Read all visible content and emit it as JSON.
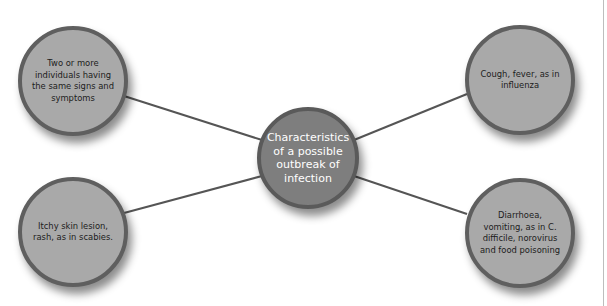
{
  "diagram": {
    "type": "mind-map",
    "center": {
      "label": "Characteristics of a possible outbreak of infection"
    },
    "nodes": [
      {
        "id": "top-left",
        "label": "Two or more individuals having the same signs and symptoms"
      },
      {
        "id": "top-right",
        "label": "Cough, fever, as in influenza"
      },
      {
        "id": "bottom-left",
        "label": "Itchy skin lesion, rash, as in scabies."
      },
      {
        "id": "bottom-right",
        "label": "Diarrhoea, vomiting, as in C. difficile, norovirus and food poisoning"
      }
    ],
    "colors": {
      "node_fill": "#a9a9a9",
      "center_fill": "#7e7e7e",
      "border": "#5f5f5f",
      "connector": "#555555"
    }
  }
}
